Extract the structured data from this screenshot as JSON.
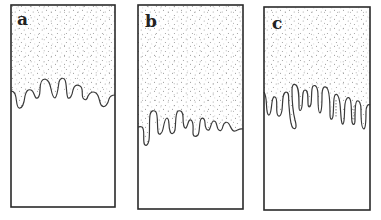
{
  "figure": {
    "colors": {
      "border": "#2a2a2a",
      "stipple": "#8a8a8a",
      "interface": "#3a3a3a",
      "background": "#ffffff"
    },
    "panels": [
      {
        "id": "a",
        "label": "a",
        "stage": "short rounded fingers"
      },
      {
        "id": "b",
        "label": "b",
        "stage": "moderate fingers"
      },
      {
        "id": "c",
        "label": "c",
        "stage": "long narrow fingers"
      }
    ]
  }
}
